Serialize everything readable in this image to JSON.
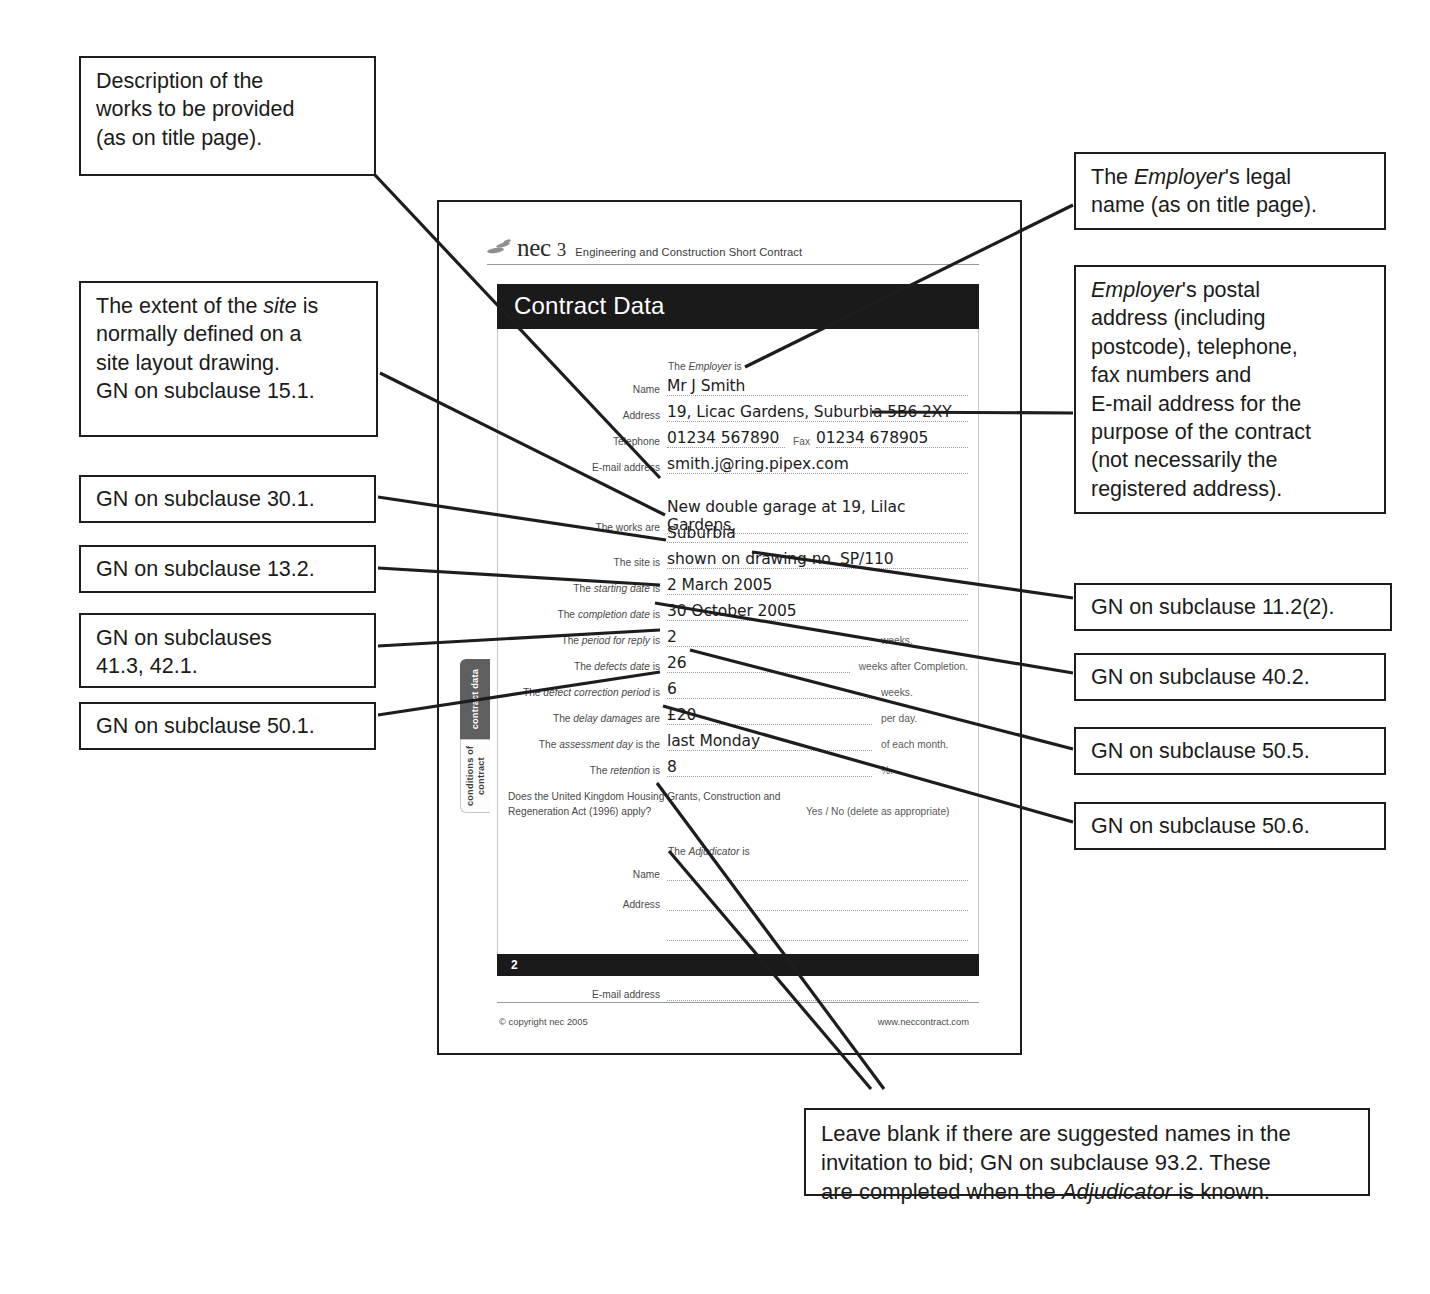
{
  "document": {
    "masthead": {
      "brand": "nec",
      "version": "3",
      "subtitle": "Engineering and Construction Short Contract"
    },
    "title": "Contract Data",
    "side_tabs": [
      {
        "label": "contract data",
        "style": "dark"
      },
      {
        "label": "conditions of contract",
        "style": "light"
      }
    ],
    "employer_section": {
      "lead_in": "The Employer is",
      "rows": [
        {
          "label": "Name",
          "value": "Mr J Smith"
        },
        {
          "label": "Address",
          "value": "19, Licac Gardens, Suburbia 5B6 2XY"
        },
        {
          "label": "Telephone",
          "value": "01234 567890",
          "mid_label": "Fax",
          "mid_value": "01234 678905"
        },
        {
          "label": "E-mail address",
          "value": "smith.j@ring.pipex.com"
        }
      ]
    },
    "works_section": {
      "rows": [
        {
          "label": "The works are",
          "value": "New double garage at 19, Lilac Gardens,"
        },
        {
          "label": "",
          "value": "Suburbia"
        },
        {
          "label": "The site is",
          "value": "shown on drawing no. SP/110"
        },
        {
          "label": "The starting date is",
          "value": "2 March 2005"
        },
        {
          "label": "The completion date is",
          "value": "30 October 2005"
        },
        {
          "label": "The period for reply is",
          "value": "2",
          "unit": "weeks."
        },
        {
          "label": "The defects date is",
          "value": "26",
          "unit": "weeks after Completion."
        },
        {
          "label": "The defect correction period is",
          "value": "6",
          "unit": "weeks."
        },
        {
          "label": "The delay damages are",
          "value": "£20",
          "unit": "per day."
        },
        {
          "label": "The assessment day is the",
          "value": "last Monday",
          "unit": "of each month."
        },
        {
          "label": "The retention is",
          "value": "8",
          "unit": "%."
        }
      ]
    },
    "hga": {
      "question": "Does the United Kingdom Housing Grants, Construction and\nRegeneration Act (1996) apply?",
      "answer": "Yes / No (delete as appropriate)"
    },
    "adjudicator_section": {
      "lead_in": "The Adjudicator is",
      "rows": [
        {
          "label": "Name",
          "value": ""
        },
        {
          "label": "Address",
          "value": ""
        },
        {
          "label": "",
          "value": ""
        },
        {
          "label": "Telephone",
          "value": "",
          "mid_label": "Fax",
          "mid_value": ""
        },
        {
          "label": "E-mail address",
          "value": ""
        }
      ]
    },
    "page_number": "2",
    "footer": {
      "copyright": "© copyright nec 2005",
      "website": "www.neccontract.com"
    }
  },
  "callouts": {
    "works_description": "Description of the\nworks to be provided\n(as on title page).",
    "site_extent_line1": "The extent of the ",
    "site_extent_italic": "site",
    "site_extent_line2": " is\nnormally defined on a\nsite layout drawing.\nGN on subclause 15.1.",
    "gn_30_1": "GN on subclause 30.1.",
    "gn_13_2": "GN on subclause 13.2.",
    "gn_41_42": "GN on subclauses\n41.3, 42.1.",
    "gn_50_1": "GN on subclause 50.1.",
    "employer_name_pre": "The ",
    "employer_name_italic": "Employer",
    "employer_name_post": "'s legal\nname (as on title page).",
    "employer_address_italic": "Employer",
    "employer_address_post": "'s postal\naddress (including\npostcode), telephone,\nfax numbers and\nE-mail address for the\npurpose of the contract\n(not necessarily the\nregistered address).",
    "gn_11_2_2": "GN on subclause 11.2(2).",
    "gn_40_2": "GN on subclause 40.2.",
    "gn_50_5": "GN on subclause 50.5.",
    "gn_50_6": "GN on subclause 50.6.",
    "adjudicator_pre": "Leave blank if there are suggested names in the\ninvitation to bid; GN on subclause 93.2. These\nare completed when the ",
    "adjudicator_italic": "Adjudicator",
    "adjudicator_post": " is known."
  },
  "colors": {
    "ink": "#1d1d1d",
    "title_bar": "#1a1a1a",
    "tab_dark": "#5f5f5f",
    "dotted_rule": "#9d9d9d"
  }
}
